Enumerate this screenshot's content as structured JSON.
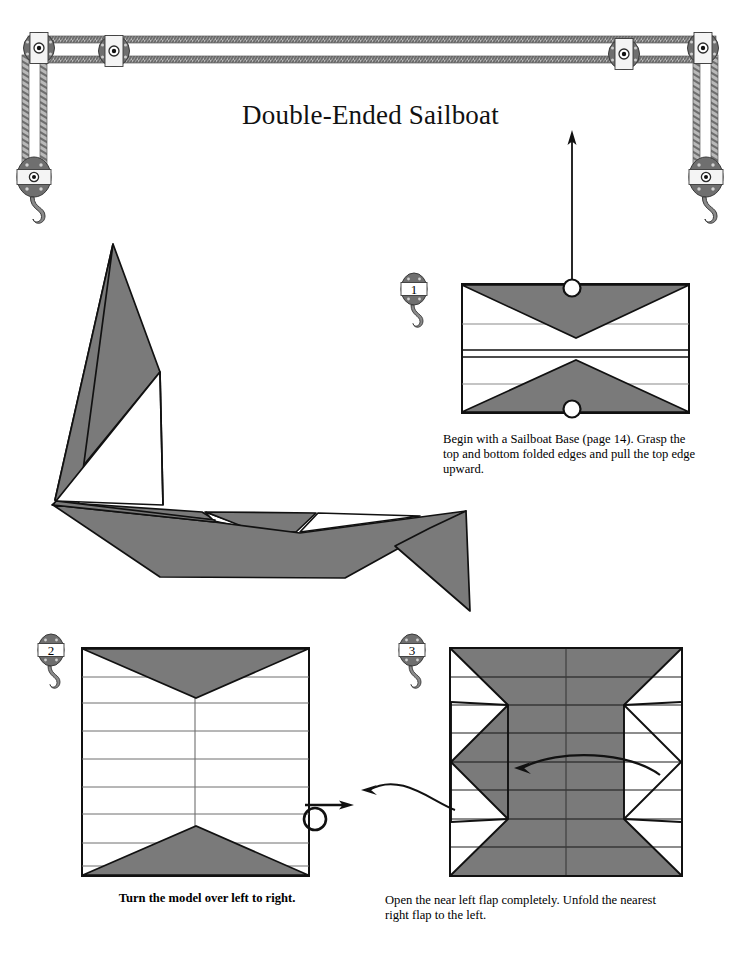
{
  "document": {
    "title": "Double-Ended Sailboat",
    "page_background": "#ffffff",
    "ink_color": "#000000",
    "paper_gray": "#7a7a7a",
    "paper_gray_light": "#8a8a8a"
  },
  "header_decoration": {
    "name": "pulley-and-rope-border",
    "description": "Decorative block-and-tackle rope border across the top of the page with four pulley wheels and two hanging hook blocks",
    "pulley_count": 4,
    "hook_block_count": 2,
    "rope_color": "#9a9a9a",
    "pulley_dark": "#6f6f6f",
    "pulley_light": "#f2f2f2"
  },
  "illustration": {
    "name": "finished-double-ended-sailboat",
    "caption": "",
    "description": "Large finished origami double-ended sailboat with a tall mainsail, a smaller jib and a long double-pointed hull"
  },
  "steps": [
    {
      "number": "1",
      "badge_name": "pulley-step-badge-1",
      "caption": "Begin with a Sailboat Base (page 14). Grasp the top and bottom folded edges and pull the top edge upward.",
      "caption_bold": false,
      "diagram": {
        "name": "step-1-diagram",
        "shape": "wide-rectangle",
        "horizontal_fold_lines": 4,
        "gray_triangles": 2,
        "grasp_circles": 2,
        "arrows": [
          {
            "name": "pull-up-arrow",
            "direction": "up",
            "style": "straight"
          }
        ]
      }
    },
    {
      "number": "2",
      "badge_name": "pulley-step-badge-2",
      "caption": "Turn the model over left to right.",
      "caption_bold": true,
      "diagram": {
        "name": "step-2-diagram",
        "shape": "square",
        "horizontal_fold_lines": 8,
        "vertical_center_line": true,
        "gray_triangles": 2,
        "arrows": [
          {
            "name": "turn-over-arrow",
            "direction": "left-to-right",
            "style": "loop"
          }
        ]
      }
    },
    {
      "number": "3",
      "badge_name": "pulley-step-badge-3",
      "caption": "Open the near left flap completely. Unfold the nearest right flap to the left.",
      "caption_bold": false,
      "diagram": {
        "name": "step-3-diagram",
        "shape": "square",
        "horizontal_fold_lines": 8,
        "vertical_lines": 2,
        "gray_regions": "double-arrow chevron body with pointed left and right tips",
        "arrows": [
          {
            "name": "open-left-flap-arrow",
            "direction": "left",
            "style": "curved"
          },
          {
            "name": "unfold-right-flap-arrow",
            "direction": "left",
            "style": "curved"
          }
        ]
      }
    }
  ]
}
